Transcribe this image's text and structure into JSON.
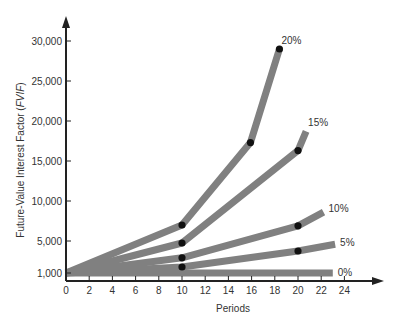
{
  "chart_data": {
    "type": "line",
    "title": "",
    "xlabel": "Periods",
    "ylabel": "Future-Value Interest Factor (FVIF)",
    "ylabel_plain": "Future-Value Interest Factor (",
    "ylabel_italic": "FVIF",
    "ylabel_close": ")",
    "xlim": [
      0,
      24
    ],
    "ylim": [
      0,
      30000
    ],
    "x_ticks": [
      0,
      2,
      4,
      6,
      8,
      10,
      12,
      14,
      16,
      18,
      20,
      22,
      24
    ],
    "y_ticks": [
      1000,
      5000,
      10000,
      15000,
      20000,
      25000,
      30000
    ],
    "y_tick_labels": [
      "1,000",
      "5,000",
      "10,000",
      "15,000",
      "20,000",
      "25,000",
      "30,000"
    ],
    "grid": false,
    "legend": "inline labels at line ends",
    "line_color": "#808080",
    "marker_color": "#111111",
    "axis_color": "#222222",
    "series": [
      {
        "name": "20%",
        "x": [
          0,
          10,
          15.9,
          18.4
        ],
        "values": [
          1000,
          7000,
          17300,
          29000
        ],
        "markers": [
          10,
          15.9,
          18.4
        ]
      },
      {
        "name": "15%",
        "x": [
          0,
          10,
          20,
          20.7
        ],
        "values": [
          1000,
          4750,
          16300,
          18700
        ],
        "markers": [
          10,
          20
        ]
      },
      {
        "name": "10%",
        "x": [
          0,
          10,
          20,
          22.2
        ],
        "values": [
          1000,
          2900,
          6900,
          8600
        ],
        "markers": [
          10,
          20
        ]
      },
      {
        "name": "5%",
        "x": [
          0,
          10,
          20,
          23.2
        ],
        "values": [
          1000,
          1750,
          3750,
          4600
        ],
        "markers": [
          10,
          20
        ]
      },
      {
        "name": "0%",
        "x": [
          0,
          23
        ],
        "values": [
          1000,
          1000
        ],
        "markers": []
      }
    ]
  }
}
